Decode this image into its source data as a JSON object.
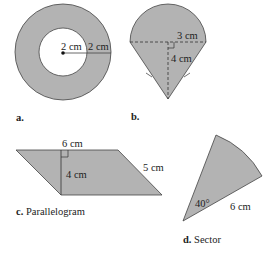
{
  "colors": {
    "fill": "#b3b3b3",
    "stroke": "#444444",
    "text": "#222222",
    "background": "#ffffff"
  },
  "figures": {
    "a": {
      "caption_letter": "a.",
      "caption_name": "",
      "shape": "annulus",
      "inner_radius_label": "2 cm",
      "ring_width_label": "2 cm"
    },
    "b": {
      "caption_letter": "b.",
      "caption_name": "",
      "shape": "semicircle on isosceles triangle",
      "radius_label": "3 cm",
      "height_label": "4 cm"
    },
    "c": {
      "caption_letter": "c.",
      "caption_name": "Parallelogram",
      "base_label": "6 cm",
      "height_label": "4 cm",
      "side_label": "5 cm"
    },
    "d": {
      "caption_letter": "d.",
      "caption_name": "Sector",
      "angle_label": "40°",
      "radius_label": "6 cm"
    }
  }
}
